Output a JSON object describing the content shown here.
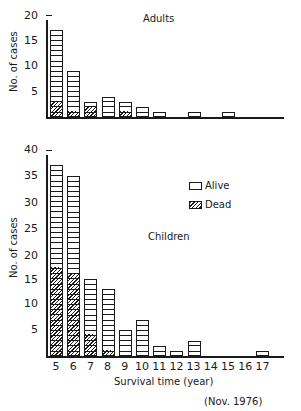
{
  "chart_data": [
    {
      "type": "bar",
      "stacked": true,
      "title": "Adults",
      "xlabel": "Survival time (year)",
      "ylabel": "No. of cases",
      "ylim": [
        0,
        20
      ],
      "yticks": [
        5,
        10,
        15,
        20
      ],
      "categories": [
        5,
        6,
        7,
        8,
        9,
        10,
        11,
        12,
        13,
        14,
        15,
        16,
        17
      ],
      "series": [
        {
          "name": "Alive",
          "values": [
            14,
            8,
            1,
            4,
            2,
            2,
            1,
            0,
            1,
            0,
            1,
            0,
            0
          ]
        },
        {
          "name": "Dead",
          "values": [
            3,
            1,
            2,
            0,
            1,
            0,
            0,
            0,
            0,
            0,
            0,
            0,
            0
          ]
        }
      ],
      "totals": [
        17,
        9,
        3,
        4,
        3,
        2,
        1,
        0,
        1,
        0,
        1,
        0,
        0
      ]
    },
    {
      "type": "bar",
      "stacked": true,
      "title": "Children",
      "xlabel": "Survival time (year)",
      "ylabel": "No. of cases",
      "ylim": [
        0,
        40
      ],
      "yticks": [
        5,
        10,
        15,
        20,
        25,
        30,
        35,
        40
      ],
      "categories": [
        5,
        6,
        7,
        8,
        9,
        10,
        11,
        12,
        13,
        14,
        15,
        16,
        17
      ],
      "series": [
        {
          "name": "Alive",
          "values": [
            20,
            19,
            11,
            12,
            5,
            7,
            2,
            1,
            3,
            0,
            0,
            0,
            1
          ]
        },
        {
          "name": "Dead",
          "values": [
            17,
            16,
            4,
            1,
            0,
            0,
            0,
            0,
            0,
            0,
            0,
            0,
            0
          ]
        }
      ],
      "totals": [
        37,
        35,
        15,
        13,
        5,
        7,
        2,
        1,
        3,
        0,
        0,
        0,
        1
      ]
    }
  ],
  "legend": {
    "alive": "Alive",
    "dead": "Dead"
  },
  "labels": {
    "adults_title": "Adults",
    "children_title": "Children",
    "ylabel": "No. of cases",
    "xlabel": "Survival time (year)",
    "date_note": "(Nov. 1976)"
  },
  "xticks": [
    "5",
    "6",
    "7",
    "8",
    "9",
    "10",
    "11",
    "12",
    "13",
    "14",
    "15",
    "16",
    "17"
  ],
  "adult_yticks": [
    "20",
    "15",
    "10",
    "5"
  ],
  "child_yticks": [
    "40",
    "35",
    "30",
    "25",
    "20",
    "15",
    "10",
    "5"
  ]
}
